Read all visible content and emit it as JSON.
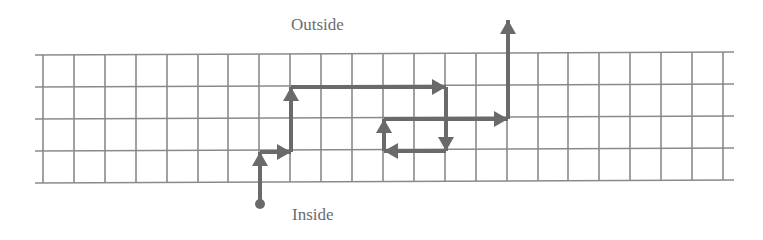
{
  "labels": {
    "outside": "Outside",
    "inside": "Inside"
  },
  "colors": {
    "grid": "#8a8a8a",
    "path": "#6a6a6a",
    "text": "#6b6b6b",
    "background": "#ffffff"
  },
  "grid": {
    "columns": 22,
    "rows": 4,
    "cell_size_px": 31
  },
  "path": {
    "description": "Random walk from inside to outside across a lattice band",
    "start": "inside",
    "end": "outside",
    "steps": [
      {
        "dir": "up",
        "len": 1.7
      },
      {
        "dir": "right",
        "len": 1
      },
      {
        "dir": "up",
        "len": 2
      },
      {
        "dir": "right",
        "len": 5
      },
      {
        "dir": "down",
        "len": 2
      },
      {
        "dir": "left",
        "len": 2
      },
      {
        "dir": "up",
        "len": 1
      },
      {
        "dir": "right",
        "len": 4
      },
      {
        "dir": "up",
        "len": 3
      }
    ]
  }
}
